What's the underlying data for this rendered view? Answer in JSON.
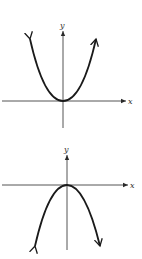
{
  "graphs": [
    {
      "name": "upward-parabola",
      "equation_shape": "y = x^2 (opens upward)",
      "x_label": "x",
      "y_label": "y",
      "vertex": [
        63,
        101
      ]
    },
    {
      "name": "downward-parabola",
      "equation_shape": "y = -x^2 (opens downward)",
      "x_label": "x",
      "y_label": "y",
      "vertex": [
        67,
        185
      ]
    }
  ],
  "colors": {
    "line": "#1a1a1a",
    "axis": "#2a2a2a",
    "background": "#ffffff"
  }
}
